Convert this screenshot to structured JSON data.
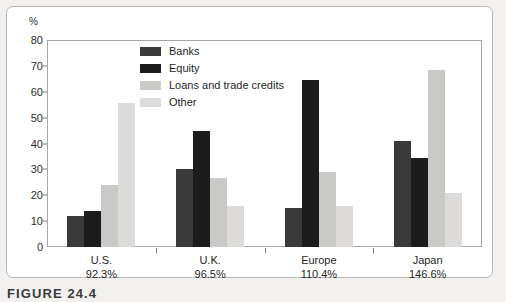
{
  "figure": {
    "caption": "FIGURE 24.4"
  },
  "chart_data": {
    "type": "bar",
    "title": "",
    "xlabel": "",
    "ylabel": "%",
    "ylim": [
      0,
      80
    ],
    "yticks": [
      0,
      10,
      20,
      30,
      40,
      50,
      60,
      70,
      80
    ],
    "grid": false,
    "legend_position": "inside-top-left",
    "categories": [
      "U.S.",
      "U.K.",
      "Europe",
      "Japan"
    ],
    "category_sublabels": [
      "92.3%",
      "96.5%",
      "110.4%",
      "146.6%"
    ],
    "series": [
      {
        "name": "Banks",
        "color": "#3a3a3a",
        "values": [
          12,
          30,
          15,
          41
        ]
      },
      {
        "name": "Equity",
        "color": "#1c1c1c",
        "values": [
          14,
          45,
          64.5,
          34.5
        ]
      },
      {
        "name": "Loans and trade credits",
        "color": "#c9c9c7",
        "values": [
          24,
          26.5,
          29,
          68.5
        ]
      },
      {
        "name": "Other",
        "color": "#dcdbd9",
        "values": [
          55.5,
          16,
          16,
          21
        ]
      }
    ]
  }
}
